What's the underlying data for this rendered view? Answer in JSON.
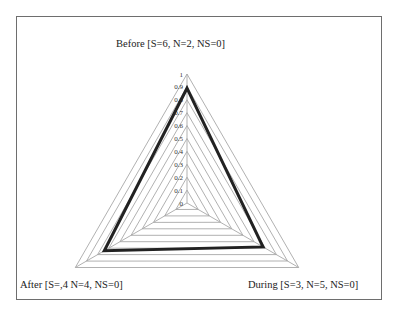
{
  "chart_data": {
    "type": "radar",
    "title": "",
    "axes": [
      "Before [S=6, N=2, NS=0]",
      "During [S=3, N=5, NS=0]",
      "After [S=,4 N=4, NS=0]"
    ],
    "series": [
      {
        "name": "",
        "values": [
          0.89,
          0.68,
          0.74
        ],
        "color": "#222222"
      }
    ],
    "radial_ticks": [
      "0",
      "0.1",
      "0.2",
      "0.3",
      "0.4",
      "0.5",
      "0.6",
      "0.7",
      "0.8",
      "0.9",
      "1"
    ],
    "rlim": [
      0,
      1
    ],
    "grid": true,
    "legend": false
  },
  "labels": {
    "top": "Before [S=6, N=2, NS=0]",
    "bottom_right": "During [S=3, N=5, NS=0]",
    "bottom_left": "After [S=,4 N=4, NS=0]"
  },
  "colors": {
    "grid": "#a8a8a8",
    "series": "#222222",
    "frame": "#6e6e6e"
  }
}
